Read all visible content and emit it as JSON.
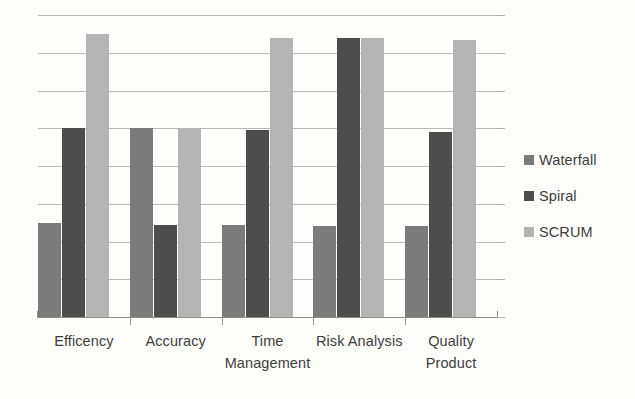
{
  "chart_data": {
    "type": "bar",
    "title": "",
    "subtitle": "",
    "xlabel": "",
    "ylabel": "",
    "categories": [
      "Efficency",
      "Accuracy",
      "Time Management",
      "Risk Analysis",
      "Quality Product"
    ],
    "category_lines": [
      [
        "Efficency"
      ],
      [
        "Accuracy"
      ],
      [
        "Time",
        "Management"
      ],
      [
        "Risk Analysis"
      ],
      [
        "Quality",
        "Product"
      ]
    ],
    "series": [
      {
        "name": "Waterfall",
        "color": "#7b7b7b",
        "values": [
          2.5,
          5.0,
          2.45,
          2.4,
          2.4
        ]
      },
      {
        "name": "Spiral",
        "color": "#4d4d4d",
        "values": [
          5.0,
          2.45,
          4.95,
          7.4,
          4.9
        ]
      },
      {
        "name": "SCRUM",
        "color": "#b4b4b4",
        "values": [
          7.5,
          5.0,
          7.4,
          7.4,
          7.35
        ]
      }
    ],
    "ylim": [
      0,
      8
    ],
    "y_tick_values": [
      0,
      1,
      2,
      3,
      4,
      5,
      6,
      7,
      8
    ],
    "y_tick_labels": [],
    "grid": true,
    "grid_axis": "y",
    "legend_position": "right",
    "bar_orientation": "vertical",
    "grouping": "clustered"
  },
  "legend": {
    "items": [
      {
        "label": "Waterfall",
        "color": "#7b7b7b",
        "swatch_name": "legend-swatch-waterfall"
      },
      {
        "label": "Spiral",
        "color": "#4d4d4d",
        "swatch_name": "legend-swatch-spiral"
      },
      {
        "label": "SCRUM",
        "color": "#b4b4b4",
        "swatch_name": "legend-swatch-scrum"
      }
    ]
  },
  "style": {
    "background": "#fdfdfb",
    "gridline_color": "#b9b9b6",
    "axis_color": "#8d8d8a",
    "text_color": "#3d3d3d"
  }
}
